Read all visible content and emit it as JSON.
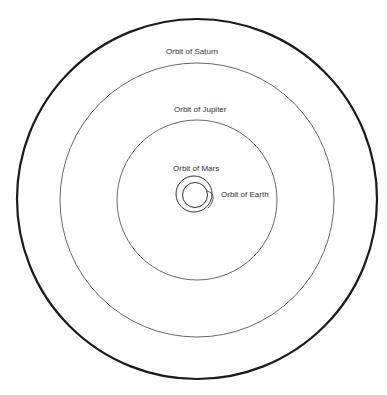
{
  "diagram": {
    "colors": {
      "outer": "#1a1a1a",
      "orbit": "#555555",
      "label": "#333333"
    },
    "labels": {
      "saturn": "Orbit of Saturn",
      "jupiter": "Orbit of Jupiter",
      "mars": "Orbit of Mars",
      "earth": "Orbit of Earth"
    },
    "orbits": [
      {
        "name": "Earth",
        "cx": 195,
        "cy": 195,
        "r": 12
      },
      {
        "name": "Mars",
        "cx": 194,
        "cy": 194,
        "r": 18
      },
      {
        "name": "Jupiter",
        "cx": 197,
        "cy": 200,
        "r": 80
      },
      {
        "name": "Saturn",
        "cx": 197,
        "cy": 200,
        "r": 137
      }
    ],
    "boundary": {
      "cx": 197,
      "cy": 199,
      "r": 180
    }
  }
}
